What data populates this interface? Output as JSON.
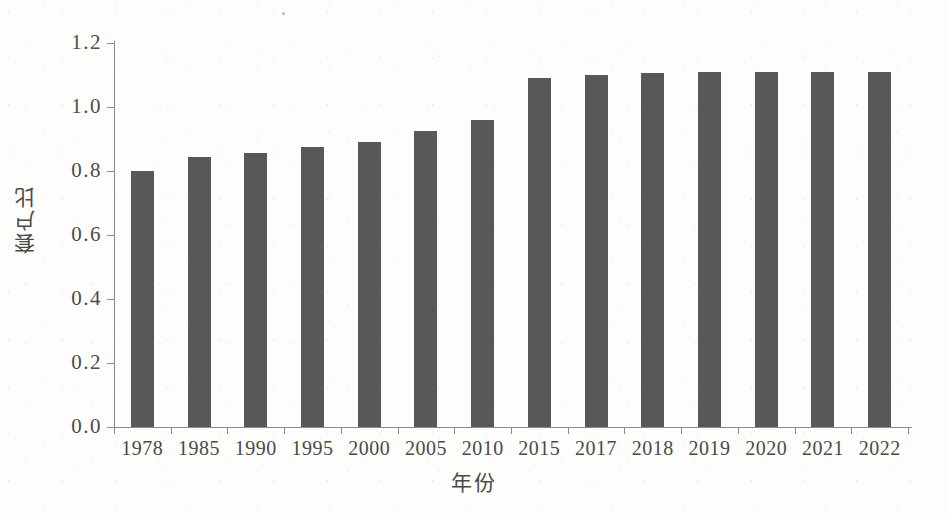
{
  "chart_data": {
    "type": "bar",
    "title": "",
    "xlabel": "年份",
    "ylabel": "套户比",
    "categories": [
      "1978",
      "1985",
      "1990",
      "1995",
      "2000",
      "2005",
      "2010",
      "2015",
      "2017",
      "2018",
      "2019",
      "2020",
      "2021",
      "2022"
    ],
    "values": [
      0.8,
      0.845,
      0.855,
      0.875,
      0.89,
      0.925,
      0.96,
      1.09,
      1.1,
      1.105,
      1.11,
      1.11,
      1.108,
      1.11
    ],
    "series": [
      {
        "name": "套户比",
        "values": [
          0.8,
          0.845,
          0.855,
          0.875,
          0.89,
          0.925,
          0.96,
          1.09,
          1.1,
          1.105,
          1.11,
          1.11,
          1.108,
          1.11
        ]
      }
    ],
    "ylim": [
      0.0,
      1.2
    ],
    "ytick_labels": [
      "0.0",
      "0.2",
      "0.4",
      "0.6",
      "0.8",
      "1.0",
      "1.2"
    ],
    "ytick_values": [
      0.0,
      0.2,
      0.4,
      0.6,
      0.8,
      1.0,
      1.2
    ],
    "grid": false,
    "legend": false,
    "legend_position": "none",
    "bar_color": "#585858",
    "axis_color": "#8b8b8b",
    "background_color": "#fdfdfc"
  }
}
